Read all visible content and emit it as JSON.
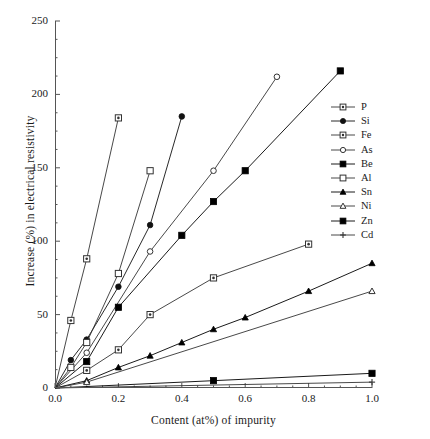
{
  "chart_data": {
    "type": "line",
    "title": "",
    "xlabel": "Content (at%) of impurity",
    "ylabel": "Increase (%) in electrical resistivity",
    "xlim": [
      0.0,
      1.0
    ],
    "ylim": [
      0,
      250
    ],
    "xticks": [
      "0.0",
      "0.2",
      "0.4",
      "0.6",
      "0.8",
      "1.0"
    ],
    "xtick_values": [
      0.0,
      0.2,
      0.4,
      0.6,
      0.8,
      1.0
    ],
    "yticks": [
      "0",
      "50",
      "100",
      "150",
      "200",
      "250"
    ],
    "ytick_values": [
      0,
      50,
      100,
      150,
      200,
      250
    ],
    "grid": false,
    "legend_position": "center-right",
    "minor_ticks": true,
    "series": [
      {
        "name": "P",
        "marker": "crossed-square",
        "color": "#333333",
        "x": [
          0.0,
          0.05,
          0.1,
          0.2
        ],
        "y": [
          0,
          46,
          88,
          184
        ]
      },
      {
        "name": "Si",
        "marker": "filled-circle",
        "color": "#111111",
        "x": [
          0.0,
          0.05,
          0.1,
          0.2,
          0.3,
          0.4
        ],
        "y": [
          0,
          19,
          33,
          69,
          111,
          185
        ]
      },
      {
        "name": "Fe",
        "marker": "crossed-square",
        "color": "#333333",
        "x": [
          0.0,
          0.1,
          0.2,
          0.3,
          0.5,
          0.8
        ],
        "y": [
          0,
          12,
          26,
          50,
          75,
          98
        ]
      },
      {
        "name": "As",
        "marker": "open-circle",
        "color": "#333333",
        "x": [
          0.0,
          0.1,
          0.3,
          0.5,
          0.7
        ],
        "y": [
          0,
          24,
          93,
          148,
          212
        ]
      },
      {
        "name": "Be",
        "marker": "filled-square",
        "color": "#000000",
        "x": [
          0.0,
          0.1,
          0.2,
          0.4,
          0.5,
          0.6,
          0.9
        ],
        "y": [
          0,
          18,
          55,
          104,
          127,
          148,
          216
        ]
      },
      {
        "name": "Al",
        "marker": "open-square",
        "color": "#333333",
        "x": [
          0.0,
          0.05,
          0.1,
          0.2,
          0.3
        ],
        "y": [
          0,
          14,
          31,
          78,
          148
        ]
      },
      {
        "name": "Sn",
        "marker": "filled-triangle",
        "color": "#000000",
        "x": [
          0.0,
          0.1,
          0.2,
          0.3,
          0.4,
          0.5,
          0.6,
          0.8,
          1.0
        ],
        "y": [
          0,
          5,
          14,
          22,
          31,
          40,
          48,
          66,
          85
        ]
      },
      {
        "name": "Ni",
        "marker": "open-triangle",
        "color": "#333333",
        "x": [
          0.0,
          0.1,
          1.0
        ],
        "y": [
          0,
          4,
          66
        ]
      },
      {
        "name": "Zn",
        "marker": "filled-square",
        "color": "#000000",
        "x": [
          0.0,
          0.5,
          1.0
        ],
        "y": [
          0,
          5,
          10
        ]
      },
      {
        "name": "Cd",
        "marker": "plus",
        "color": "#333333",
        "x": [
          0.0,
          1.0
        ],
        "y": [
          0,
          4
        ]
      }
    ]
  },
  "legend": {
    "items": [
      {
        "label": "P"
      },
      {
        "label": "Si"
      },
      {
        "label": "Fe"
      },
      {
        "label": "As"
      },
      {
        "label": "Be"
      },
      {
        "label": "Al"
      },
      {
        "label": "Sn"
      },
      {
        "label": "Ni"
      },
      {
        "label": "Zn"
      },
      {
        "label": "Cd"
      }
    ]
  }
}
